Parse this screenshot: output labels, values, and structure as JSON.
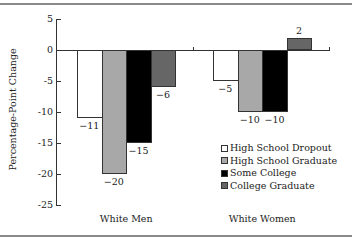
{
  "chart_data": {
    "type": "bar",
    "title": "",
    "xlabel": "",
    "ylabel": "Percentage-Point Change",
    "ylim": [
      -25,
      5
    ],
    "yticks": [
      "5",
      "0",
      "-5",
      "-10",
      "-15",
      "-20",
      "-25"
    ],
    "grid": false,
    "legend_position": "lower right",
    "categories": [
      "White Men",
      "White Women"
    ],
    "series": [
      {
        "name": "High School Dropout",
        "color": "#ffffff",
        "values": [
          -11,
          -5
        ],
        "labels": [
          "−11",
          "−5"
        ]
      },
      {
        "name": "High School Graduate",
        "color": "#a8a8a8",
        "values": [
          -20,
          -10
        ],
        "labels": [
          "−20",
          "−10"
        ]
      },
      {
        "name": "Some College",
        "color": "#000000",
        "values": [
          -15,
          -10
        ],
        "labels": [
          "−15",
          "−10"
        ]
      },
      {
        "name": "College Graduate",
        "color": "#666666",
        "values": [
          -6,
          2
        ],
        "labels": [
          "−6",
          "2"
        ]
      }
    ]
  }
}
